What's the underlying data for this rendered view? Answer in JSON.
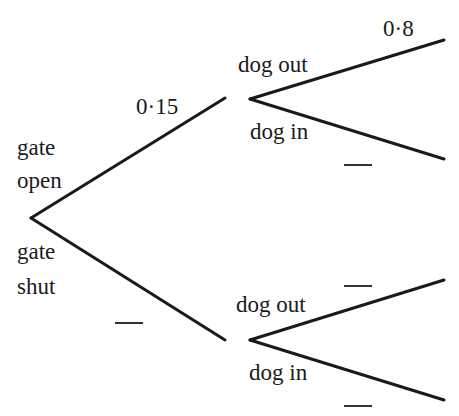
{
  "diagram": {
    "type": "probability-tree",
    "line_color": "#1a1a1a",
    "first_level": {
      "upper": {
        "label_line1": "gate",
        "label_line2": "open",
        "probability": "0·15"
      },
      "lower": {
        "label_line1": "gate",
        "label_line2": "shut",
        "probability": ""
      }
    },
    "second_level": {
      "after_open": {
        "upper": {
          "label": "dog out",
          "probability": "0·8"
        },
        "lower": {
          "label": "dog in",
          "probability": ""
        }
      },
      "after_shut": {
        "upper": {
          "label": "dog out",
          "probability": ""
        },
        "lower": {
          "label": "dog in",
          "probability": ""
        }
      }
    }
  }
}
